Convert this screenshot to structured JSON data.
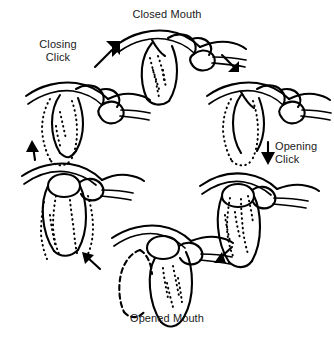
{
  "diagram": {
    "title_visible": false,
    "background_color": "#ffffff",
    "ink_color": "#000000",
    "labels": {
      "closed_mouth": "Closed Mouth",
      "opened_mouth": "Opened Mouth",
      "closing_click": "Closing\nClick",
      "opening_click": "Opening\nClick"
    },
    "panels": [
      {
        "id": "closed-mouth",
        "position": "top-center",
        "label": "Closed Mouth",
        "description": "Condyle seated in glenoid fossa, articular disc displaced anteriorly"
      },
      {
        "id": "early-opening",
        "position": "upper-right",
        "label": "",
        "description": "Condyle begins translating forward, disc still anteriorly displaced, dotted outline marks prior condyle position"
      },
      {
        "id": "opening-click",
        "position": "right",
        "label": "Opening Click",
        "description": "Condyle recaptures the disc producing the opening click"
      },
      {
        "id": "opened-mouth",
        "position": "bottom-center",
        "label": "Opened Mouth",
        "description": "Full translation of condyle beneath articular eminence with disc reduced, dashed outline marks closed position"
      },
      {
        "id": "early-closing",
        "position": "left",
        "label": "",
        "description": "Condyle translating back posteriorly with disc in place, dotted outlines mark prior positions"
      },
      {
        "id": "closing-click",
        "position": "upper-left",
        "label": "Closing Click",
        "description": "Disc slips anteriorly off the condyle producing the closing click"
      }
    ],
    "arrows": [
      {
        "id": "arrow-closing-to-closed",
        "direction": "up-right",
        "from": "closing-click",
        "to": "closed-mouth"
      },
      {
        "id": "arrow-closed-to-early-opening",
        "direction": "down-right",
        "from": "closed-mouth",
        "to": "early-opening"
      },
      {
        "id": "arrow-early-opening-to-opening-click",
        "direction": "down",
        "from": "early-opening",
        "to": "opening-click"
      },
      {
        "id": "arrow-opening-click-to-opened",
        "direction": "down-left",
        "from": "opening-click",
        "to": "opened-mouth"
      },
      {
        "id": "arrow-opened-to-early-closing",
        "direction": "up-left",
        "from": "opened-mouth",
        "to": "early-closing"
      },
      {
        "id": "arrow-early-closing-to-closing-click",
        "direction": "up",
        "from": "early-closing",
        "to": "closing-click"
      }
    ]
  }
}
